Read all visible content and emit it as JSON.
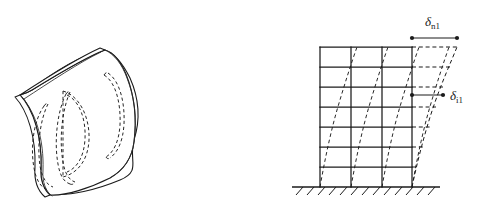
{
  "figure": {
    "title": "Curved shell panel mode shape and multi-story frame first-mode deflected shape",
    "background_color": "#ffffff",
    "line_color": "#1b1b1b",
    "width_px": 492,
    "height_px": 214
  },
  "left_panel": {
    "name": "curved-shell-panel",
    "description": "Isometric view of a singly curved shell panel with dashed interior mode-shape contour lobes",
    "edge_thickness_shown": true,
    "mode_lobe_count": 4,
    "lobes": [
      {
        "id": "lobe-1",
        "position": "left"
      },
      {
        "id": "lobe-2",
        "position": "center-left"
      },
      {
        "id": "lobe-3",
        "position": "center-right"
      },
      {
        "id": "lobe-4",
        "position": "right"
      }
    ]
  },
  "right_panel": {
    "name": "multistory-frame",
    "description": "Elevation of a multi-story moment frame with undeformed grid and dashed first-mode deflected shape",
    "story_count": 7,
    "bay_count": 3,
    "column_count": 4,
    "ground": {
      "label": "ground-hatching",
      "hatch_tick_count": 14
    },
    "annotations": [
      {
        "id": "roof-displacement",
        "symbol": "δ",
        "subscript": "n1",
        "meaning": "roof (nth floor) displacement in mode 1",
        "dimension_line": true,
        "level": "roof"
      },
      {
        "id": "story-i-displacement",
        "symbol": "δ",
        "subscript": "i1",
        "meaning": "ith floor displacement in mode 1",
        "dimension_line": true,
        "level": "floor-i"
      }
    ]
  },
  "labels": {
    "delta_n1_symbol": "δ",
    "delta_n1_sub": "n1",
    "delta_i1_symbol": "δ",
    "delta_i1_sub": "i1"
  },
  "colors": {
    "ink": "#1b1b1b",
    "paper": "#ffffff",
    "light_ink": "#2a2a2a"
  }
}
